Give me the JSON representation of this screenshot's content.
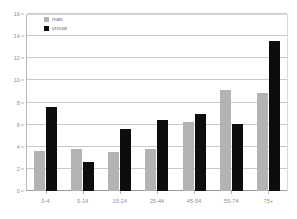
{
  "chart_data": {
    "type": "bar",
    "title": "",
    "subtitle": "",
    "xlabel": "",
    "ylabel": "",
    "categories": [
      "0-4",
      "5-14",
      "15-24",
      "25-44",
      "45-54",
      "55-74",
      "75+"
    ],
    "series": [
      {
        "name": "man",
        "color": "#b3b3b3",
        "values": [
          3.6,
          3.8,
          3.5,
          3.8,
          6.2,
          9.1,
          8.9
        ]
      },
      {
        "name": "vrouw",
        "color": "#0d0d0d",
        "values": [
          7.6,
          2.6,
          5.6,
          6.4,
          7.0,
          6.1,
          13.6
        ]
      }
    ],
    "ylim": [
      0,
      16
    ],
    "ytick_step": 2,
    "yticks": [
      "0",
      "2",
      "4",
      "6",
      "8",
      "10",
      "12",
      "14",
      "16"
    ],
    "grid": true,
    "grid_axis": "y",
    "legend": {
      "position": "top-left-inside",
      "entries": [
        {
          "label": "man",
          "swatch": "legend-swatch-gray"
        },
        {
          "label": "vrouw",
          "swatch": "legend-swatch-black"
        }
      ]
    },
    "colors": {
      "background": "#ffffff",
      "gridline": "#c9c9c9",
      "axis": "#b6b6b6",
      "tick_text": "#8d8d8d",
      "series_man": "#b3b3b3",
      "series_vrouw": "#0d0d0d"
    }
  }
}
